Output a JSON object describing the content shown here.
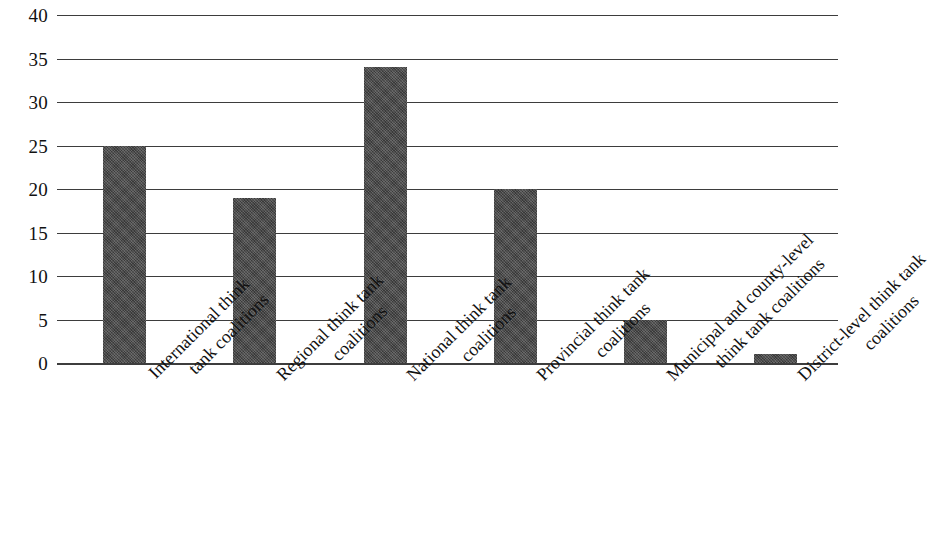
{
  "chart_data": {
    "type": "bar",
    "title": "",
    "subtitle": "",
    "xlabel": "",
    "ylabel": "",
    "ylim": [
      0,
      40
    ],
    "ytick_step": 5,
    "grid": true,
    "grid_axis": "y",
    "legend": false,
    "legend_position": "none",
    "bar_color": "#4a4a4a",
    "bar_fill_style": "dark-gray-textured",
    "background_color": "#ffffff",
    "axis_color": "#3d3d3d",
    "categories": [
      "International think tank coalitions",
      "Regional think tank coalitions",
      "National think tank coalitions",
      "Provincial think tank coalitions",
      "Municipal and county-level think tank coalitions",
      "District-level think tank coalitions"
    ],
    "category_lines": [
      [
        "International think",
        "tank coalitions"
      ],
      [
        "Regional think tank",
        "coalitions"
      ],
      [
        "National think tank",
        "coalitions"
      ],
      [
        "Provincial  think tank",
        "coalitions"
      ],
      [
        "Municipal and county-level",
        "think tank coalitions"
      ],
      [
        "District-level  think tank",
        "coalitions"
      ]
    ],
    "values": [
      25,
      19,
      34,
      20,
      5,
      1
    ],
    "yticks": [
      {
        "label": "40",
        "value": 40
      },
      {
        "label": "35",
        "value": 35
      },
      {
        "label": "30",
        "value": 30
      },
      {
        "label": "25",
        "value": 25
      },
      {
        "label": "20",
        "value": 20
      },
      {
        "label": "15",
        "value": 15
      },
      {
        "label": "10",
        "value": 10
      },
      {
        "label": "5",
        "value": 5
      },
      {
        "label": "0",
        "value": 0
      }
    ]
  }
}
